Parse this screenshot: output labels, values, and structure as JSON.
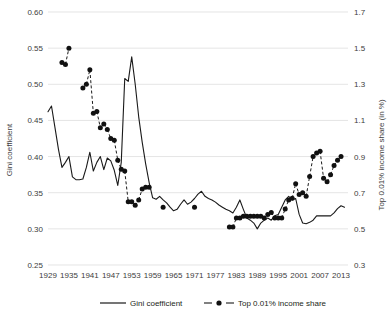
{
  "chart_data": {
    "type": "line",
    "title": "",
    "xlabel": "",
    "ylabel": "Gini coefficient",
    "y2label": "Top 0.01% income share (in %)",
    "grid": true,
    "legend_position": "bottom",
    "xlim": [
      1929,
      2015
    ],
    "ylim": [
      0.25,
      0.6
    ],
    "y2lim": [
      0.3,
      1.7
    ],
    "yticks": [
      "0.25",
      "0.30",
      "0.35",
      "0.40",
      "0.45",
      "0.50",
      "0.55",
      "0.60"
    ],
    "ytick_values": [
      0.25,
      0.3,
      0.35,
      0.4,
      0.45,
      0.5,
      0.55,
      0.6
    ],
    "y2ticks": [
      "0.3",
      "0.5",
      "0.7",
      "0.9",
      "1.1",
      "1.3",
      "1.5",
      "1.7"
    ],
    "y2tick_values": [
      0.3,
      0.5,
      0.7,
      0.9,
      1.1,
      1.3,
      1.5,
      1.7
    ],
    "xticks": [
      "1929",
      "1935",
      "1941",
      "1947",
      "1953",
      "1959",
      "1965",
      "1971",
      "1977",
      "1983",
      "1989",
      "1995",
      "2001",
      "2007",
      "2013"
    ],
    "xtick_values": [
      1929,
      1935,
      1941,
      1947,
      1953,
      1959,
      1965,
      1971,
      1977,
      1983,
      1989,
      1995,
      2001,
      2007,
      2013
    ],
    "series": [
      {
        "name": "Gini coefficient",
        "axis": "left",
        "style": "solid-line",
        "marker": "none",
        "x": [
          1929,
          1930,
          1931,
          1932,
          1933,
          1934,
          1935,
          1936,
          1937,
          1938,
          1939,
          1940,
          1941,
          1942,
          1943,
          1944,
          1945,
          1946,
          1947,
          1948,
          1949,
          1950,
          1951,
          1952,
          1953,
          1954,
          1955,
          1956,
          1957,
          1958,
          1959,
          1960,
          1961,
          1962,
          1963,
          1964,
          1965,
          1966,
          1967,
          1968,
          1969,
          1970,
          1971,
          1972,
          1973,
          1974,
          1975,
          1976,
          1977,
          1978,
          1979,
          1980,
          1981,
          1982,
          1983,
          1984,
          1985,
          1986,
          1987,
          1988,
          1989,
          1990,
          1991,
          1992,
          1993,
          1994,
          1995,
          1996,
          1997,
          1998,
          1999,
          2000,
          2001,
          2002,
          2003,
          2004,
          2005,
          2006,
          2007,
          2008,
          2009,
          2010,
          2011,
          2012,
          2013,
          2014
        ],
        "values": [
          0.462,
          0.47,
          0.44,
          0.41,
          0.385,
          0.392,
          0.4,
          0.372,
          0.368,
          0.368,
          0.369,
          0.385,
          0.406,
          0.38,
          0.392,
          0.4,
          0.382,
          0.398,
          0.394,
          0.381,
          0.36,
          0.392,
          0.508,
          0.504,
          0.538,
          0.5,
          0.455,
          0.42,
          0.39,
          0.364,
          0.343,
          0.341,
          0.345,
          0.34,
          0.336,
          0.33,
          0.325,
          0.327,
          0.334,
          0.34,
          0.334,
          0.337,
          0.342,
          0.348,
          0.352,
          0.345,
          0.342,
          0.34,
          0.337,
          0.333,
          0.33,
          0.327,
          0.325,
          0.322,
          0.33,
          0.34,
          0.327,
          0.315,
          0.312,
          0.308,
          0.3,
          0.308,
          0.312,
          0.315,
          0.312,
          0.318,
          0.32,
          0.33,
          0.34,
          0.345,
          0.34,
          0.342,
          0.32,
          0.308,
          0.307,
          0.309,
          0.312,
          0.318,
          0.318,
          0.318,
          0.318,
          0.318,
          0.322,
          0.328,
          0.332,
          0.33
        ],
        "line_values_note": "solid black line, no markers"
      },
      {
        "name": "Top 0.01% income share",
        "axis": "right",
        "style": "dashed-line",
        "marker": "filled-circle",
        "x": [
          1933,
          1934,
          1935,
          1939,
          1940,
          1941,
          1942,
          1943,
          1944,
          1945,
          1946,
          1947,
          1948,
          1949,
          1950,
          1951,
          1952,
          1953,
          1954,
          1955,
          1956,
          1957,
          1958,
          1962,
          1971,
          1981,
          1982,
          1983,
          1984,
          1985,
          1986,
          1987,
          1988,
          1989,
          1990,
          1991,
          1992,
          1993,
          1994,
          1995,
          1996,
          1997,
          1998,
          1999,
          2000,
          2001,
          2002,
          2003,
          2004,
          2005,
          2006,
          2007,
          2008,
          2009,
          2010,
          2011,
          2012,
          2013
        ],
        "values": [
          1.42,
          1.41,
          1.5,
          1.28,
          1.3,
          1.38,
          1.14,
          1.15,
          1.06,
          1.08,
          1.05,
          1.0,
          0.99,
          0.88,
          0.83,
          0.82,
          0.65,
          0.65,
          0.63,
          0.66,
          0.72,
          0.73,
          0.73,
          0.62,
          0.62,
          0.51,
          0.51,
          0.56,
          0.56,
          0.57,
          0.57,
          0.57,
          0.57,
          0.57,
          0.57,
          0.56,
          0.58,
          0.59,
          0.56,
          0.56,
          0.56,
          0.61,
          0.66,
          0.67,
          0.75,
          0.69,
          0.7,
          0.68,
          0.79,
          0.9,
          0.92,
          0.93,
          0.78,
          0.76,
          0.8,
          0.85,
          0.88,
          0.9
        ],
        "marker_note": "black filled circles connected by dashed segments, gaps where data absent"
      }
    ]
  },
  "axes": {
    "left_title": "Gini coefficient",
    "right_title": "Top 0.01% income share (in %)"
  },
  "legend": {
    "items": [
      {
        "label": "Gini coefficient",
        "style": "solid-line"
      },
      {
        "label": "Top 0.01% income share",
        "style": "dashed-line-with-marker"
      }
    ]
  },
  "colors": {
    "line": "#1a1a1a",
    "marker": "#111111",
    "grid": "#d9d9d9",
    "text": "#3c3c3c",
    "background": "#ffffff"
  }
}
